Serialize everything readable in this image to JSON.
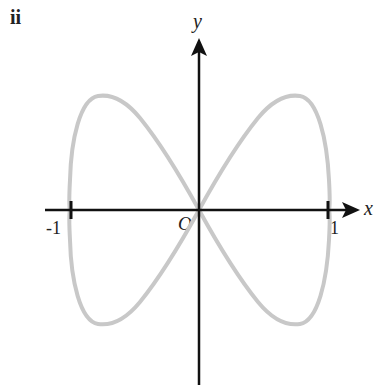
{
  "figure": {
    "part_label": "ii",
    "x_axis_label": "x",
    "y_axis_label": "y",
    "origin_label": "O",
    "tick_labels": {
      "neg_one": "-1",
      "pos_one": "1"
    },
    "curve_color": "#c8c8c8",
    "axis_color": "#111111",
    "curve_description": "Figure-eight (Lissajous) curve x = sin t, y ≈ 0.88·sin 2t, crossing at origin, meeting x-axis at x = -1 and x = 1"
  }
}
